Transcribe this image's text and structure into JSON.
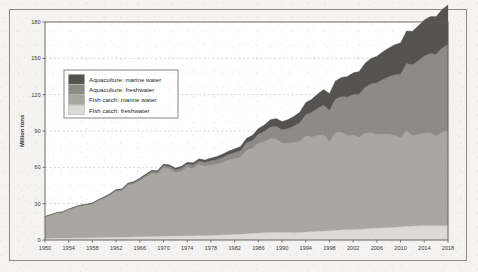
{
  "chart_data": {
    "type": "area",
    "stacked": true,
    "title": "",
    "xlabel": "",
    "ylabel": "Million tons",
    "ylim": [
      0,
      180
    ],
    "xlim": [
      1950,
      2018
    ],
    "ytick_labels": [
      "0",
      "30",
      "60",
      "90",
      "120",
      "150",
      "180"
    ],
    "yticks": [
      0,
      30,
      60,
      90,
      120,
      150,
      180
    ],
    "xtick_labels": [
      "1950",
      "1954",
      "1958",
      "1962",
      "1966",
      "1970",
      "1974",
      "1978",
      "1982",
      "1986",
      "1990",
      "1994",
      "1998",
      "2002",
      "2006",
      "2010",
      "2014",
      "2018"
    ],
    "xticks": [
      1950,
      1954,
      1958,
      1962,
      1966,
      1970,
      1974,
      1978,
      1982,
      1986,
      1990,
      1994,
      1998,
      2002,
      2006,
      2010,
      2014,
      2018
    ],
    "grid": true,
    "grid_axis": "y",
    "legend_position": "upper left inside",
    "x": [
      1950,
      1951,
      1952,
      1953,
      1954,
      1955,
      1956,
      1957,
      1958,
      1959,
      1960,
      1961,
      1962,
      1963,
      1964,
      1965,
      1966,
      1967,
      1968,
      1969,
      1970,
      1971,
      1972,
      1973,
      1974,
      1975,
      1976,
      1977,
      1978,
      1979,
      1980,
      1981,
      1982,
      1983,
      1984,
      1985,
      1986,
      1987,
      1988,
      1989,
      1990,
      1991,
      1992,
      1993,
      1994,
      1995,
      1996,
      1997,
      1998,
      1999,
      2000,
      2001,
      2002,
      2003,
      2004,
      2005,
      2006,
      2007,
      2008,
      2009,
      2010,
      2011,
      2012,
      2013,
      2014,
      2015,
      2016,
      2017,
      2018
    ],
    "series": [
      {
        "name": "Fish catch: freshwater",
        "color": "#dcdad6",
        "values": [
          1.4,
          1.5,
          1.6,
          1.6,
          1.7,
          1.8,
          1.9,
          1.9,
          2.0,
          2.1,
          2.2,
          2.3,
          2.4,
          2.4,
          2.5,
          2.6,
          2.7,
          2.8,
          2.9,
          3.0,
          3.1,
          3.2,
          3.3,
          3.4,
          3.5,
          3.6,
          3.7,
          3.8,
          3.9,
          4.1,
          4.3,
          4.5,
          4.7,
          4.9,
          5.2,
          5.5,
          5.8,
          6.1,
          6.3,
          6.4,
          6.4,
          6.3,
          6.2,
          6.4,
          6.7,
          7.0,
          7.3,
          7.5,
          7.7,
          8.0,
          8.4,
          8.6,
          8.7,
          8.9,
          9.2,
          9.6,
          9.9,
          10.1,
          10.3,
          10.5,
          11.0,
          11.3,
          11.6,
          11.7,
          11.9,
          12.0,
          11.9,
          12.0,
          12.0
        ]
      },
      {
        "name": "Fish catch: marine water",
        "color": "#a9a7a2",
        "values": [
          17.6,
          19.0,
          20.4,
          21.0,
          23.0,
          24.6,
          26.0,
          26.6,
          27.4,
          30.0,
          32.0,
          34.5,
          37.5,
          38.0,
          42.5,
          43.5,
          46.0,
          49.0,
          52.0,
          51.5,
          56.5,
          55.5,
          52.5,
          53.5,
          56.5,
          55.5,
          58.5,
          57.0,
          58.0,
          58.5,
          60.0,
          61.5,
          62.5,
          63.5,
          69.0,
          70.0,
          74.0,
          75.0,
          77.5,
          77.0,
          73.5,
          73.5,
          74.5,
          75.0,
          79.0,
          78.0,
          79.0,
          79.5,
          73.5,
          80.5,
          80.5,
          78.0,
          78.0,
          76.0,
          79.0,
          79.0,
          77.0,
          77.5,
          77.0,
          76.0,
          73.5,
          79.0,
          74.5,
          75.5,
          76.5,
          76.5,
          74.0,
          77.0,
          78.0
        ]
      },
      {
        "name": "Aquaculture: freshwater",
        "color": "#8d8b86",
        "values": [
          0.5,
          0.5,
          0.6,
          0.6,
          0.7,
          0.7,
          0.8,
          0.8,
          0.9,
          1.0,
          1.1,
          1.1,
          1.2,
          1.3,
          1.4,
          1.5,
          1.6,
          1.7,
          1.8,
          1.9,
          2.0,
          2.2,
          2.3,
          2.5,
          2.7,
          2.9,
          3.1,
          3.3,
          3.6,
          3.9,
          4.2,
          4.6,
          5.0,
          5.4,
          6.0,
          6.8,
          7.6,
          8.6,
          9.6,
          10.6,
          11.2,
          12.2,
          13.5,
          15.5,
          18.0,
          20.5,
          22.5,
          24.5,
          26.0,
          28.0,
          29.5,
          31.5,
          33.5,
          35.5,
          38.0,
          40.5,
          43.0,
          45.0,
          47.5,
          50.0,
          52.5,
          55.5,
          58.5,
          61.0,
          63.5,
          65.5,
          67.5,
          69.5,
          71.5
        ]
      },
      {
        "name": "Aquaculture: marine water",
        "color": "#55534f",
        "values": [
          0.1,
          0.1,
          0.2,
          0.2,
          0.2,
          0.3,
          0.3,
          0.3,
          0.4,
          0.4,
          0.5,
          0.5,
          0.6,
          0.6,
          0.7,
          0.7,
          0.8,
          0.9,
          0.9,
          1.0,
          1.1,
          1.2,
          1.3,
          1.4,
          1.5,
          1.7,
          1.8,
          2.0,
          2.2,
          2.4,
          2.6,
          2.8,
          3.1,
          3.4,
          3.8,
          4.2,
          4.7,
          5.2,
          5.8,
          6.3,
          6.8,
          7.4,
          8.0,
          8.8,
          9.8,
          10.8,
          11.8,
          12.8,
          13.8,
          14.8,
          15.8,
          16.8,
          17.8,
          18.8,
          19.8,
          20.8,
          21.8,
          22.8,
          23.8,
          24.8,
          25.8,
          26.8,
          27.8,
          28.8,
          29.8,
          30.5,
          31.2,
          31.8,
          32.5
        ]
      }
    ],
    "legend_entries": [
      {
        "label": "Aquaculture: marine water",
        "color": "#55534f"
      },
      {
        "label": "Aquaculture: freshwater",
        "color": "#8d8b86"
      },
      {
        "label": "Fish catch: marine water",
        "color": "#a9a7a2"
      },
      {
        "label": "Fish catch: freshwater",
        "color": "#dcdad6"
      }
    ]
  },
  "colors": {
    "frame": "#8d8a86",
    "grid": "#bfbdb8",
    "paper": "#f4f3f1",
    "plot_bg": "#ffffff",
    "text": "#2e2e2e"
  }
}
